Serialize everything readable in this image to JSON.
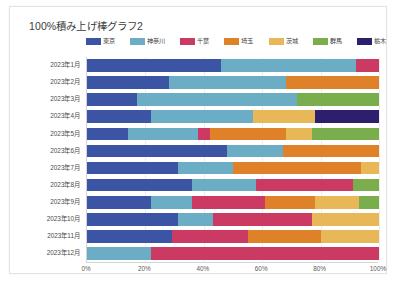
{
  "chart_data": {
    "type": "bar",
    "subtype": "100% stacked horizontal bar",
    "title": "100%積み上げ棒グラフ2",
    "xlabel": "",
    "ylabel": "",
    "xlim": [
      0,
      100
    ],
    "xticks": [
      "0%",
      "20%",
      "40%",
      "60%",
      "80%",
      "100%"
    ],
    "xtick_values": [
      0,
      20,
      40,
      60,
      80,
      100
    ],
    "grid": true,
    "legend_position": "top",
    "categories": [
      "2023年1月",
      "2023年2月",
      "2023年3月",
      "2023年4月",
      "2023年5月",
      "2023年6月",
      "2023年7月",
      "2023年8月",
      "2023年9月",
      "2023年10月",
      "2023年11月",
      "2023年12月"
    ],
    "series": [
      {
        "name": "東京",
        "color": "#3b55a4",
        "values": [
          46,
          28,
          17,
          22,
          14,
          48,
          31,
          36,
          22,
          31,
          29,
          0
        ]
      },
      {
        "name": "神奈川",
        "color": "#6aadc4",
        "values": [
          46,
          40,
          55,
          35,
          24,
          19,
          19,
          22,
          14,
          12,
          0,
          22
        ]
      },
      {
        "name": "千葉",
        "color": "#ca3a63",
        "values": [
          8,
          0,
          0,
          0,
          4,
          0,
          0,
          33,
          25,
          34,
          26,
          78
        ]
      },
      {
        "name": "埼玉",
        "color": "#df8128",
        "values": [
          0,
          32,
          0,
          0,
          26,
          33,
          44,
          0,
          17,
          0,
          25,
          0
        ]
      },
      {
        "name": "茨城",
        "color": "#e8b757",
        "values": [
          0,
          0,
          0,
          21,
          9,
          0,
          6,
          0,
          15,
          23,
          20,
          0
        ]
      },
      {
        "name": "群馬",
        "color": "#7aad4c",
        "values": [
          0,
          0,
          28,
          0,
          23,
          0,
          0,
          9,
          7,
          0,
          0,
          0
        ]
      },
      {
        "name": "栃木",
        "color": "#2d1f6e",
        "values": [
          0,
          0,
          0,
          22,
          0,
          0,
          0,
          0,
          0,
          0,
          0,
          0
        ]
      }
    ]
  }
}
